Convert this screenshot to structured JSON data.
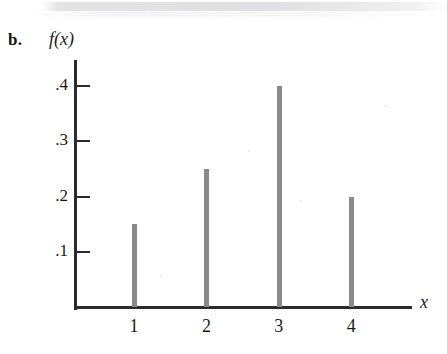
{
  "figure": {
    "part_label": "b.",
    "y_axis_title": "f(x)",
    "x_axis_title": "x"
  },
  "chart_data": {
    "type": "bar",
    "title": "",
    "subtitle": "",
    "xlabel": "x",
    "ylabel": "f(x)",
    "categories": [
      "1",
      "2",
      "3",
      "4"
    ],
    "x": [
      1,
      2,
      3,
      4
    ],
    "values": [
      0.15,
      0.25,
      0.4,
      0.2
    ],
    "ylim": [
      0,
      0.44
    ],
    "xlim": [
      0,
      4.8
    ],
    "ytick_labels": [
      ".1",
      ".2",
      ".3",
      ".4"
    ],
    "ytick_values": [
      0.1,
      0.2,
      0.3,
      0.4
    ],
    "xtick_labels": [
      "1",
      "2",
      "3",
      "4"
    ],
    "xtick_values": [
      1,
      2,
      3,
      4
    ],
    "grid": false,
    "legend": null,
    "series": [
      {
        "name": "f(x)",
        "values": [
          0.15,
          0.25,
          0.4,
          0.2
        ]
      }
    ],
    "bar_color": "#898989",
    "axis_color": "#2b2b2b",
    "annotations": [
      "b."
    ]
  }
}
